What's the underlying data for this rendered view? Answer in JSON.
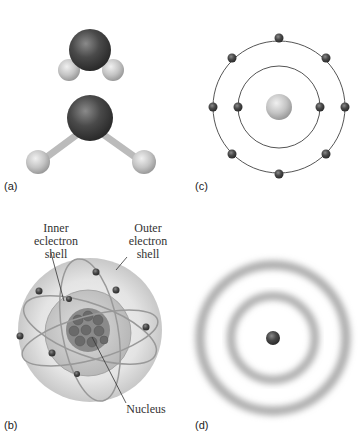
{
  "panels": {
    "a": {
      "label": "(a)",
      "description": "Space-filling and ball-and-stick water molecule models"
    },
    "b": {
      "label": "(b)",
      "annotations": {
        "inner_shell": [
          "Inner",
          "eclectron",
          "shell"
        ],
        "outer_shell": [
          "Outer",
          "electron",
          "shell"
        ],
        "nucleus": "Nucleus"
      }
    },
    "c": {
      "label": "(c)",
      "inner_shell_electrons": 2,
      "outer_shell_electrons": 8
    },
    "d": {
      "label": "(d)",
      "shells": 2
    }
  },
  "colors": {
    "oxygen": "#4a4a4a",
    "hydrogen": "#c8c8c8",
    "orbit": "#555555",
    "cloud": "#aaaaaa"
  }
}
